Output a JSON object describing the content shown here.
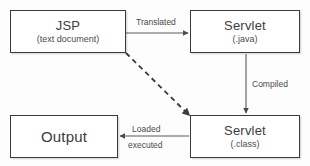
{
  "diagram": {
    "background_color": "#fdfdfd",
    "border_color": "#3a3a3a",
    "text_color": "#3c3c3c",
    "edge_color": "#5a5a5a",
    "nodes": [
      {
        "id": "jsp",
        "title": "JSP",
        "subtitle": "(text document)"
      },
      {
        "id": "sjava",
        "title": "Servlet",
        "subtitle": "(.java)"
      },
      {
        "id": "sclass",
        "title": "Servlet",
        "subtitle": "(.class)"
      },
      {
        "id": "output",
        "title": "Output",
        "subtitle": ""
      }
    ],
    "edges": [
      {
        "id": "translated",
        "label": "Translated",
        "from": "jsp",
        "to": "sjava",
        "style": "solid",
        "direction": "right"
      },
      {
        "id": "compiled",
        "label": "Compiled",
        "from": "sjava",
        "to": "sclass",
        "style": "solid",
        "direction": "down"
      },
      {
        "id": "loaded",
        "label": "Loaded",
        "from": "sclass",
        "to": "output",
        "style": "solid",
        "direction": "left"
      },
      {
        "id": "executed",
        "label": "executed",
        "from": "sclass",
        "to": "output",
        "style": "solid",
        "direction": "left"
      },
      {
        "id": "direct",
        "label": "",
        "from": "jsp",
        "to": "sclass",
        "style": "dashed",
        "direction": "diagonal"
      }
    ]
  }
}
